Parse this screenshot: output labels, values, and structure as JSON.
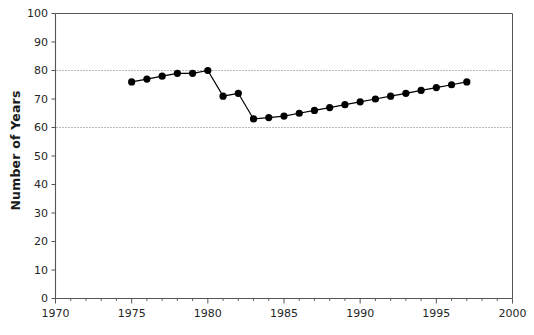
{
  "chart_data": {
    "type": "line",
    "title": "",
    "subtitle": "",
    "xlabel": "",
    "ylabel": "Number of Years",
    "xlim": [
      1970,
      2000
    ],
    "ylim": [
      0,
      100
    ],
    "xtick_labels": [
      "1970",
      "1975",
      "1980",
      "1985",
      "1990",
      "1995",
      "2000"
    ],
    "xticks": [
      1970,
      1975,
      1980,
      1985,
      1990,
      1995,
      2000
    ],
    "xtick_minor_step": 1,
    "ytick_labels": [
      "0",
      "10",
      "20",
      "30",
      "40",
      "50",
      "60",
      "70",
      "80",
      "90",
      "100"
    ],
    "yticks": [
      0,
      10,
      20,
      30,
      40,
      50,
      60,
      70,
      80,
      90,
      100
    ],
    "grid": "horizontal-dotted",
    "gridlines": [
      60,
      80
    ],
    "legend": "none",
    "marker": "filled-circle",
    "line_color": "#000000",
    "marker_color": "#000000",
    "grid_color": "#777777",
    "axis_color": "#555555",
    "series": [
      {
        "name": "Number of Years",
        "x": [
          1975,
          1976,
          1977,
          1978,
          1979,
          1980,
          1981,
          1982,
          1983,
          1984,
          1985,
          1986,
          1987,
          1988,
          1989,
          1990,
          1991,
          1992,
          1993,
          1994,
          1995,
          1996,
          1997
        ],
        "values": [
          76,
          77,
          78,
          79,
          79,
          80,
          71,
          72,
          63,
          63.5,
          64,
          65,
          66,
          67,
          68,
          69,
          70,
          71,
          72,
          73,
          74,
          75,
          76
        ]
      }
    ]
  }
}
